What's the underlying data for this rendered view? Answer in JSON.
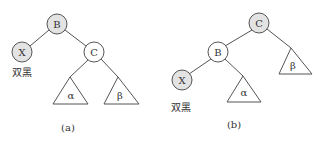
{
  "colors": {
    "black_node_fill": "#e3e3e3",
    "white_node_fill": "#ffffff",
    "stroke": "#555555",
    "text": "#333333"
  },
  "diagram_a": {
    "caption": "(a)",
    "nodes": {
      "B": {
        "label": "B",
        "color": "black"
      },
      "X": {
        "label": "X",
        "color": "black",
        "note": "双黑"
      },
      "C": {
        "label": "C",
        "color": "white"
      }
    },
    "subtrees": {
      "alpha": "α",
      "beta": "β"
    }
  },
  "diagram_b": {
    "caption": "(b)",
    "nodes": {
      "C": {
        "label": "C",
        "color": "black"
      },
      "B": {
        "label": "B",
        "color": "white"
      },
      "X": {
        "label": "X",
        "color": "black",
        "note": "双黑"
      }
    },
    "subtrees": {
      "alpha": "α",
      "beta": "β"
    }
  }
}
